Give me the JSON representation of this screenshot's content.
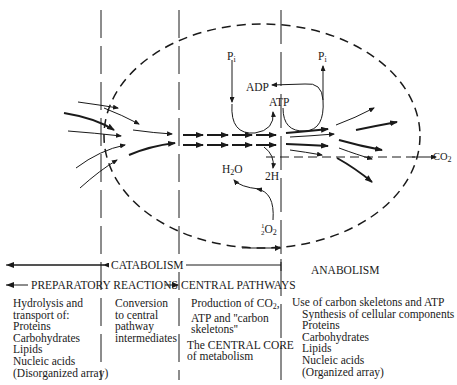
{
  "diagram": {
    "labels": {
      "pi_in": "P",
      "pi_in_sub": "i",
      "pi_out": "P",
      "pi_out_sub": "i",
      "adp": "ADP",
      "atp": "ATP",
      "water": "H",
      "water_sub": "2",
      "water_tail": "O",
      "two_h": "2H",
      "half_o2_num": "1",
      "half_o2_den": "2",
      "half_o2_main": "O",
      "half_o2_sub": "2",
      "co2": "CO",
      "co2_sub": "2"
    },
    "phases": {
      "catabolism": "CATABOLISM",
      "preparatory": "PREPARATORY REACTIONS",
      "central": "CENTRAL PATHWAYS",
      "anabolism": "ANABOLISM"
    },
    "columns": {
      "preparatory": [
        "Hydrolysis and",
        "transport of:",
        "Proteins",
        "Carbohydrates",
        "Lipids",
        "Nucleic acids",
        "(Disorganized array)"
      ],
      "conversion": [
        "Conversion",
        "to central",
        "pathway",
        "intermediates"
      ],
      "central": {
        "line1": "Production of CO",
        "line1_sub": "2",
        "line1_tail": ",",
        "line2": "ATP and ''carbon",
        "line3": "skeletons''",
        "core1": "The CENTRAL CORE",
        "core2": "of metabolism"
      },
      "anabolism": {
        "head": "Use of carbon skeletons and ATP",
        "items": [
          "Synthesis of cellular components",
          "Proteins",
          "Carbohydrates",
          "Lipids",
          "Nucleic acids",
          "(Organized array)"
        ]
      }
    }
  }
}
